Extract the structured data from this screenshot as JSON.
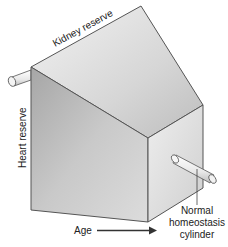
{
  "diagram": {
    "type": "3d-block-illustration",
    "labels": {
      "top_edge": "Kidney reserve",
      "left_edge": "Heart reserve",
      "bottom_axis": "Age",
      "cylinder_caption_line1": "Normal",
      "cylinder_caption_line2": "homeostasis",
      "cylinder_caption_line3": "cylinder"
    },
    "colors": {
      "outline": "#555555",
      "face_light": "#e6e6e6",
      "face_mid": "#c8c8c8",
      "face_dark": "#a9a9a9",
      "text": "#222222"
    }
  }
}
